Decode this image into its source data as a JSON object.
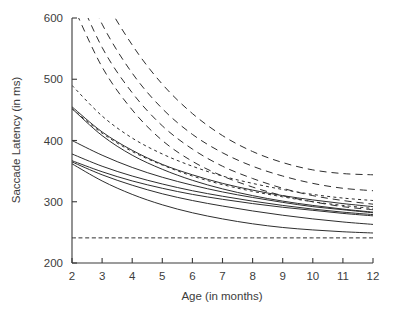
{
  "chart_data": {
    "type": "line",
    "title": "",
    "xlabel": "Age (in months)",
    "ylabel": "Saccade Latency (in ms)",
    "xlim": [
      2,
      12
    ],
    "ylim": [
      200,
      600
    ],
    "xticks": [
      2,
      3,
      4,
      5,
      6,
      7,
      8,
      9,
      10,
      11,
      12
    ],
    "yticks": [
      200,
      300,
      400,
      500,
      600
    ],
    "xtick_labels": [
      "2",
      "3",
      "4",
      "5",
      "6",
      "7",
      "8",
      "9",
      "10",
      "11",
      "12"
    ],
    "ytick_labels": [
      "200",
      "300",
      "400",
      "500",
      "600"
    ],
    "grid": false,
    "legend": "none",
    "x": [
      2,
      3,
      4,
      5,
      6,
      7,
      8,
      9,
      10,
      11,
      12
    ],
    "series": [
      {
        "name": "dashed-1",
        "style": "dashed",
        "values": [
          760,
          640,
          556,
          492,
          444,
          408,
          382,
          364,
          352,
          346,
          344
        ]
      },
      {
        "name": "dashed-2",
        "style": "dashed",
        "values": [
          700,
          590,
          510,
          452,
          410,
          380,
          358,
          342,
          330,
          322,
          318
        ]
      },
      {
        "name": "dashed-3",
        "style": "dashed",
        "values": [
          660,
          552,
          478,
          424,
          386,
          358,
          338,
          322,
          310,
          302,
          296
        ]
      },
      {
        "name": "dashed-4",
        "style": "dashed",
        "values": [
          624,
          520,
          450,
          400,
          366,
          342,
          324,
          310,
          300,
          292,
          287
        ]
      },
      {
        "name": "dotted-1",
        "style": "dotted",
        "values": [
          490,
          440,
          404,
          378,
          358,
          342,
          330,
          320,
          312,
          306,
          302
        ]
      },
      {
        "name": "dotted-2",
        "style": "dotted",
        "values": [
          452,
          412,
          382,
          360,
          342,
          328,
          317,
          308,
          300,
          294,
          289
        ]
      },
      {
        "name": "solid-1",
        "style": "solid",
        "values": [
          455,
          414,
          384,
          361,
          344,
          330,
          319,
          310,
          303,
          297,
          292
        ]
      },
      {
        "name": "solid-2",
        "style": "solid",
        "values": [
          452,
          408,
          376,
          353,
          335,
          321,
          310,
          301,
          294,
          288,
          283
        ]
      },
      {
        "name": "solid-3",
        "style": "solid",
        "values": [
          400,
          376,
          356,
          340,
          327,
          316,
          307,
          299,
          292,
          287,
          282
        ]
      },
      {
        "name": "solid-4",
        "style": "solid",
        "values": [
          378,
          358,
          342,
          329,
          318,
          309,
          301,
          294,
          288,
          283,
          279
        ]
      },
      {
        "name": "solid-5",
        "style": "solid",
        "values": [
          367,
          349,
          334,
          322,
          312,
          304,
          297,
          291,
          286,
          281,
          277
        ]
      },
      {
        "name": "solid-6",
        "style": "solid",
        "values": [
          365,
          344,
          327,
          313,
          302,
          293,
          285,
          278,
          272,
          267,
          263
        ]
      },
      {
        "name": "solid-7",
        "style": "solid",
        "values": [
          362,
          334,
          312,
          295,
          282,
          272,
          264,
          258,
          254,
          251,
          249
        ]
      },
      {
        "name": "reference-line",
        "style": "reference",
        "values": [
          241,
          241,
          241,
          241,
          241,
          241,
          241,
          241,
          241,
          241,
          241
        ]
      }
    ]
  }
}
